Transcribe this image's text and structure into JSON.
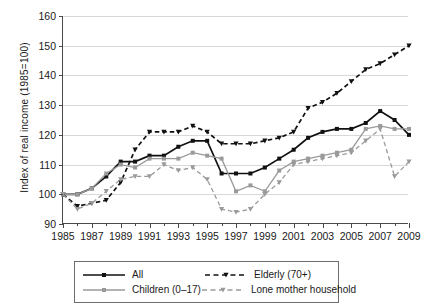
{
  "chart_data": {
    "type": "line",
    "title": "",
    "xlabel": "",
    "ylabel": "Index of real income (1985=100)",
    "xlim": [
      1985,
      2009
    ],
    "ylim": [
      90,
      160
    ],
    "yticks": [
      90,
      100,
      110,
      120,
      130,
      140,
      150,
      160
    ],
    "xticks": [
      1985,
      1987,
      1989,
      1991,
      1993,
      1995,
      1997,
      1999,
      2001,
      2003,
      2005,
      2007,
      2009
    ],
    "minor_xticks_every": 1,
    "grid": "horizontal",
    "legend_position": "below-center",
    "x": [
      1985,
      1986,
      1987,
      1988,
      1989,
      1990,
      1991,
      1992,
      1993,
      1994,
      1995,
      1996,
      1997,
      1998,
      1999,
      2000,
      2001,
      2002,
      2003,
      2004,
      2005,
      2006,
      2007,
      2008,
      2009
    ],
    "series": [
      {
        "name": "All",
        "color": "#111111",
        "style": "solid",
        "marker": "square",
        "values": [
          100,
          100,
          102,
          106,
          111,
          111,
          113,
          113,
          116,
          118,
          118,
          107,
          107,
          107,
          109,
          112,
          115,
          119,
          121,
          122,
          122,
          124,
          128,
          125,
          120
        ]
      },
      {
        "name": "Children (0-17)",
        "color": "#9a9a9a",
        "style": "solid",
        "marker": "square",
        "values": [
          100,
          100,
          102,
          107,
          110,
          109,
          112,
          112,
          112,
          114,
          113,
          112,
          101,
          103,
          101,
          108,
          111,
          112,
          113,
          114,
          115,
          122,
          123,
          122,
          122
        ]
      },
      {
        "name": "Elderly (70+)",
        "color": "#111111",
        "style": "dashed",
        "marker": "triangle",
        "values": [
          100,
          96,
          97,
          98,
          104,
          115,
          121,
          121,
          121,
          123,
          121,
          117,
          117,
          117,
          118,
          119,
          121,
          129,
          131,
          134,
          138,
          142,
          144,
          147,
          150
        ]
      },
      {
        "name": "Lone mother household",
        "color": "#9a9a9a",
        "style": "dashed",
        "marker": "triangle",
        "values": [
          100,
          95,
          97,
          101,
          105,
          106,
          106,
          110,
          108,
          109,
          105,
          95,
          94,
          95,
          100,
          104,
          110,
          111,
          112,
          113,
          114,
          118,
          122,
          106,
          111
        ]
      }
    ]
  },
  "axes": {
    "y_title": "Index of real income (1985=100)",
    "y_tick_labels": [
      "90",
      "100",
      "110",
      "120",
      "130",
      "140",
      "150",
      "160"
    ],
    "x_tick_labels": [
      "1985",
      "1987",
      "1989",
      "1991",
      "1993",
      "1995",
      "1997",
      "1999",
      "2001",
      "2003",
      "2005",
      "2007",
      "2009"
    ]
  },
  "legend": {
    "entries": [
      {
        "label": "All",
        "color": "#111111",
        "style": "solid",
        "marker": "square"
      },
      {
        "label": "Elderly (70+)",
        "color": "#111111",
        "style": "dashed",
        "marker": "triangle"
      },
      {
        "label": "Children (0–17)",
        "color": "#9a9a9a",
        "style": "solid",
        "marker": "square"
      },
      {
        "label": "Lone mother household",
        "color": "#9a9a9a",
        "style": "dashed",
        "marker": "triangle"
      }
    ]
  }
}
